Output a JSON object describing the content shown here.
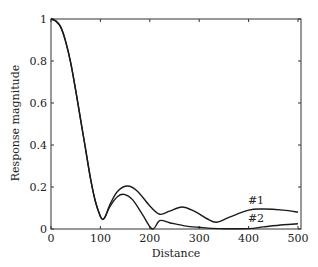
{
  "chart_data": {
    "type": "line",
    "title": "",
    "xlabel": "Distance",
    "ylabel": "Response magnitude",
    "xlim": [
      0,
      500
    ],
    "ylim": [
      0,
      1
    ],
    "xticks": [
      0,
      100,
      200,
      300,
      400,
      500
    ],
    "xtick_labels": [
      "0",
      "100",
      "200",
      "300",
      "400",
      "500"
    ],
    "yticks": [
      0,
      0.2,
      0.4,
      0.6,
      0.8,
      1
    ],
    "ytick_labels": [
      "0",
      "0.2",
      "0.4",
      "0.6",
      "0.8",
      "1"
    ],
    "grid": false,
    "legend": "none (inline annotations)",
    "series": [
      {
        "name": "#1",
        "x": [
          0,
          10,
          20,
          30,
          40,
          50,
          60,
          70,
          80,
          90,
          100,
          105,
          110,
          120,
          135,
          155,
          175,
          200,
          220,
          240,
          265,
          290,
          315,
          335,
          360,
          400,
          430,
          470,
          500
        ],
        "y": [
          1.0,
          0.99,
          0.96,
          0.89,
          0.79,
          0.66,
          0.52,
          0.38,
          0.24,
          0.13,
          0.06,
          0.045,
          0.06,
          0.12,
          0.18,
          0.205,
          0.18,
          0.11,
          0.07,
          0.085,
          0.105,
          0.085,
          0.05,
          0.032,
          0.055,
          0.09,
          0.095,
          0.09,
          0.08
        ]
      },
      {
        "name": "#2",
        "x": [
          0,
          10,
          20,
          30,
          40,
          50,
          60,
          70,
          80,
          90,
          100,
          105,
          110,
          120,
          135,
          148,
          165,
          185,
          205,
          220,
          240,
          270,
          300,
          340,
          400,
          430,
          470,
          500
        ],
        "y": [
          1.0,
          0.99,
          0.96,
          0.89,
          0.79,
          0.66,
          0.52,
          0.38,
          0.24,
          0.13,
          0.06,
          0.045,
          0.06,
          0.11,
          0.155,
          0.165,
          0.14,
          0.07,
          0.0,
          0.04,
          0.03,
          0.015,
          0.008,
          0.002,
          0.002,
          0.01,
          0.02,
          0.025
        ]
      }
    ],
    "annotations": [
      {
        "text": "#1",
        "x": 415,
        "y": 0.12
      },
      {
        "text": "#2",
        "x": 415,
        "y": 0.035
      }
    ]
  }
}
